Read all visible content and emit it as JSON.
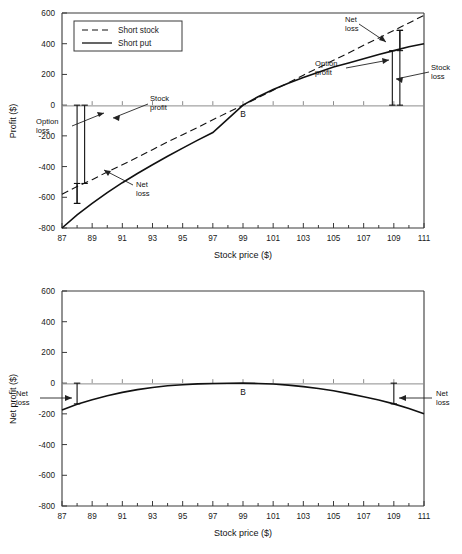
{
  "chart_data": [
    {
      "id": "top",
      "type": "line",
      "title": "",
      "xlabel": "Stock price ($)",
      "ylabel": "Profit ($)",
      "xlim": [
        87,
        111
      ],
      "ylim": [
        -800,
        600
      ],
      "xticks": [
        87,
        89,
        91,
        93,
        95,
        97,
        99,
        101,
        103,
        105,
        107,
        109,
        111
      ],
      "yticks": [
        600,
        400,
        200,
        0,
        -200,
        -400,
        -600,
        -800
      ],
      "minor_xticks": [
        88,
        90,
        92,
        94,
        96,
        98,
        100,
        102,
        104,
        106,
        108,
        110
      ],
      "grid": false,
      "legend_position": "upper-left",
      "zero_line": true,
      "x": [
        87,
        88,
        89,
        90,
        91,
        92,
        93,
        94,
        95,
        96,
        97,
        98,
        99,
        100,
        101,
        102,
        103,
        104,
        105,
        106,
        107,
        108,
        109,
        110,
        111
      ],
      "series": [
        {
          "name": "Short stock",
          "style": "dashed",
          "values": [
            -580,
            -530,
            -485,
            -435,
            -388,
            -340,
            -290,
            -240,
            -193,
            -145,
            -95,
            -48,
            0,
            48,
            97,
            145,
            195,
            243,
            292,
            340,
            390,
            437,
            487,
            535,
            585
          ]
        },
        {
          "name": "Short put",
          "style": "solid",
          "values": [
            -800,
            -715,
            -640,
            -570,
            -505,
            -445,
            -388,
            -333,
            -280,
            -228,
            -178,
            -90,
            0,
            55,
            102,
            142,
            180,
            215,
            248,
            275,
            302,
            330,
            355,
            380,
            400
          ]
        }
      ],
      "point_labels": [
        {
          "label": "B",
          "x": 99,
          "y": -55
        }
      ],
      "annotations": [
        {
          "name": "option-loss",
          "text": "Option\nloss",
          "lines": [
            "Option",
            "loss"
          ]
        },
        {
          "name": "stock-profit",
          "text": "Stock\nprofit",
          "lines": [
            "Stock",
            "profit"
          ]
        },
        {
          "name": "net-loss-left",
          "text": "Net\nloss",
          "lines": [
            "Net",
            "loss"
          ]
        },
        {
          "name": "net-loss-right",
          "text": "Net\nloss",
          "lines": [
            "Net",
            "loss"
          ]
        },
        {
          "name": "option-profit",
          "text": "Option\nprofit",
          "lines": [
            "Option",
            "profit"
          ]
        },
        {
          "name": "stock-loss",
          "text": "Stock\nloss",
          "lines": [
            "Stock",
            "loss"
          ]
        }
      ],
      "brackets": [
        {
          "name": "option-loss-bracket",
          "x": 88,
          "y_from": 0,
          "y_to": -640
        },
        {
          "name": "stock-profit-bracket",
          "x": 88.5,
          "y_from": 0,
          "y_to": -510
        },
        {
          "name": "net-loss-left-bracket",
          "x": 88,
          "y_from": -510,
          "y_to": -640
        },
        {
          "name": "stock-loss-bracket",
          "x": 109.4,
          "y_from": 0,
          "y_to": 487
        },
        {
          "name": "option-profit-bracket",
          "x": 108.9,
          "y_from": 0,
          "y_to": 355
        },
        {
          "name": "net-loss-right-bracket",
          "x": 109.4,
          "y_from": 355,
          "y_to": 487
        }
      ]
    },
    {
      "id": "bottom",
      "type": "line",
      "title": "",
      "xlabel": "Stock price ($)",
      "ylabel": "Net profit ($)",
      "xlim": [
        87,
        111
      ],
      "ylim": [
        -800,
        600
      ],
      "xticks": [
        87,
        89,
        91,
        93,
        95,
        97,
        99,
        101,
        103,
        105,
        107,
        109,
        111
      ],
      "yticks": [
        600,
        400,
        200,
        0,
        -200,
        -400,
        -600,
        -800
      ],
      "minor_xticks": [
        88,
        90,
        92,
        94,
        96,
        98,
        100,
        102,
        104,
        106,
        108,
        110
      ],
      "grid": false,
      "legend_position": "none",
      "zero_line": true,
      "x": [
        87,
        88,
        89,
        90,
        91,
        92,
        93,
        94,
        95,
        96,
        97,
        98,
        99,
        100,
        101,
        102,
        103,
        104,
        105,
        106,
        107,
        108,
        109,
        110,
        111
      ],
      "series": [
        {
          "name": "Net profit",
          "style": "solid",
          "values": [
            -175,
            -137,
            -108,
            -82,
            -60,
            -42,
            -28,
            -17,
            -10,
            -5,
            -2,
            -1,
            0,
            -2,
            -6,
            -13,
            -23,
            -35,
            -50,
            -68,
            -88,
            -110,
            -135,
            -165,
            -200
          ]
        }
      ],
      "point_labels": [
        {
          "label": "B",
          "x": 99,
          "y": -60
        }
      ],
      "annotations": [
        {
          "name": "net-loss-left",
          "text": "Net\nloss",
          "lines": [
            "Net",
            "loss"
          ]
        },
        {
          "name": "net-loss-right",
          "text": "Net\nloss",
          "lines": [
            "Net",
            "loss"
          ]
        }
      ],
      "brackets": [
        {
          "name": "net-loss-left-bracket",
          "x": 88,
          "y_from": 0,
          "y_to": -135
        },
        {
          "name": "net-loss-right-bracket",
          "x": 109,
          "y_from": 0,
          "y_to": -135
        }
      ]
    }
  ]
}
